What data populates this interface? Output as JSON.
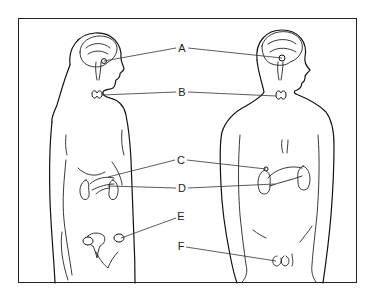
{
  "figure": {
    "type": "endocrine-system-diagram",
    "subjects": [
      "female-figure",
      "male-figure"
    ],
    "frame_color": "#222222",
    "line_color": "#111111",
    "background": "#ffffff"
  },
  "labels": [
    {
      "id": "A",
      "text": "A",
      "x": 182,
      "y": 48,
      "targets": "pituitary/hypothalamus (brain)"
    },
    {
      "id": "B",
      "text": "B",
      "x": 182,
      "y": 92,
      "targets": "thyroid"
    },
    {
      "id": "C",
      "text": "C",
      "x": 181,
      "y": 160,
      "targets": "adrenal glands"
    },
    {
      "id": "D",
      "text": "D",
      "x": 182,
      "y": 188,
      "targets": "pancreas"
    },
    {
      "id": "E",
      "text": "E",
      "x": 181,
      "y": 216,
      "targets": "ovaries"
    },
    {
      "id": "F",
      "text": "F",
      "x": 181,
      "y": 246,
      "targets": "testes"
    }
  ]
}
